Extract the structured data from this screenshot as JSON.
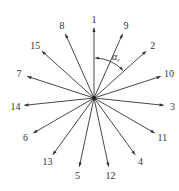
{
  "diagram": {
    "type": "vector star diagram",
    "center": {
      "x": 94,
      "y": 98
    },
    "arrow_length": 70,
    "label_offset": 9,
    "angle_step_deg": 24,
    "line_color": "#333333",
    "arrows": [
      {
        "label": "1",
        "angle": 0
      },
      {
        "label": "9",
        "angle": 24
      },
      {
        "label": "2",
        "angle": 48
      },
      {
        "label": "10",
        "angle": 72
      },
      {
        "label": "3",
        "angle": 96
      },
      {
        "label": "11",
        "angle": 120
      },
      {
        "label": "4",
        "angle": 144
      },
      {
        "label": "12",
        "angle": 168
      },
      {
        "label": "5",
        "angle": 192
      },
      {
        "label": "13",
        "angle": 216
      },
      {
        "label": "6",
        "angle": 240
      },
      {
        "label": "14",
        "angle": 264
      },
      {
        "label": "7",
        "angle": 288
      },
      {
        "label": "15",
        "angle": 312
      },
      {
        "label": "8",
        "angle": 336
      }
    ],
    "angle_annotation": {
      "symbol": "α",
      "subscript": "ε",
      "from_arrow": "1",
      "to_arrow": "2",
      "radius": 40
    }
  }
}
